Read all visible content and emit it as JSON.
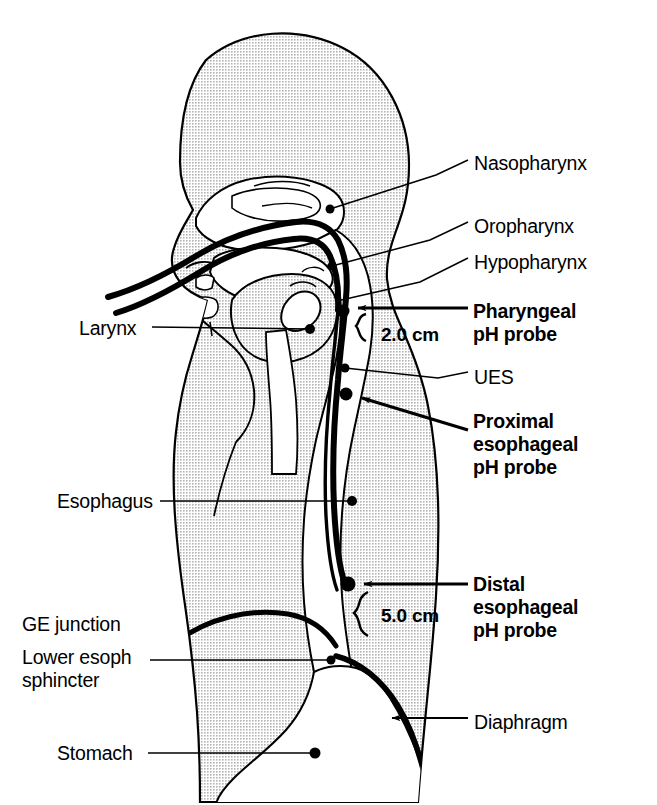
{
  "figure": {
    "type": "anatomical-diagram",
    "fill_color": "#d9d9d9",
    "line_color": "#000000",
    "background_color": "#ffffff"
  },
  "labels_right": [
    {
      "id": "nasopharynx",
      "text": "Nasopharynx",
      "bold": false,
      "x": 474,
      "y": 152
    },
    {
      "id": "oropharynx",
      "text": "Oropharynx",
      "bold": false,
      "x": 474,
      "y": 215
    },
    {
      "id": "hypopharynx",
      "text": "Hypopharynx",
      "bold": false,
      "x": 474,
      "y": 251
    },
    {
      "id": "pharyngeal-ph-probe",
      "text": "Pharyngeal\npH probe",
      "bold": true,
      "x": 473,
      "y": 300
    },
    {
      "id": "ues",
      "text": "UES",
      "bold": false,
      "x": 474,
      "y": 366
    },
    {
      "id": "proximal-esophageal-ph-probe",
      "text": "Proximal\nesophageal\npH probe",
      "bold": true,
      "x": 473,
      "y": 410
    },
    {
      "id": "distal-esophageal-ph-probe",
      "text": "Distal\nesophageal\npH probe",
      "bold": true,
      "x": 473,
      "y": 573
    },
    {
      "id": "diaphragm",
      "text": "Diaphragm",
      "bold": false,
      "x": 474,
      "y": 711
    }
  ],
  "labels_left": [
    {
      "id": "larynx",
      "text": "Larynx",
      "bold": false,
      "x": 79,
      "y": 317
    },
    {
      "id": "esophagus",
      "text": "Esophagus",
      "bold": false,
      "x": 57,
      "y": 490
    },
    {
      "id": "ge-junction",
      "text": "GE junction",
      "bold": false,
      "x": 22,
      "y": 613
    },
    {
      "id": "lower-esoph-sphincter",
      "text": "Lower esoph\nsphincter",
      "bold": false,
      "x": 22,
      "y": 646
    },
    {
      "id": "stomach",
      "text": "Stomach",
      "bold": false,
      "x": 57,
      "y": 742
    }
  ],
  "measurements": [
    {
      "id": "pharyngeal-to-ues-distance",
      "text": "2.0 cm",
      "x": 381,
      "y": 323
    },
    {
      "id": "distal-probe-to-les-distance",
      "text": "5.0 cm",
      "x": 381,
      "y": 604
    }
  ],
  "probe_markers": [
    {
      "id": "pharyngeal-probe-marker",
      "cx": 343,
      "cy": 311,
      "r": 6
    },
    {
      "id": "proximal-probe-marker",
      "cx": 346,
      "cy": 394,
      "r": 6
    },
    {
      "id": "distal-probe-marker",
      "cx": 348,
      "cy": 584,
      "r": 7
    }
  ],
  "leader_dots": [
    {
      "id": "nasopharynx-dot",
      "cx": 330,
      "cy": 209
    },
    {
      "id": "oropharynx-dot",
      "cx": 332,
      "cy": 266
    },
    {
      "id": "larynx-dot",
      "cx": 310,
      "cy": 329
    },
    {
      "id": "ues-dot",
      "cx": 345,
      "cy": 368
    },
    {
      "id": "esophagus-dot",
      "cx": 352,
      "cy": 501
    },
    {
      "id": "les-dot",
      "cx": 331,
      "cy": 660
    },
    {
      "id": "stomach-dot",
      "cx": 315,
      "cy": 753
    }
  ]
}
